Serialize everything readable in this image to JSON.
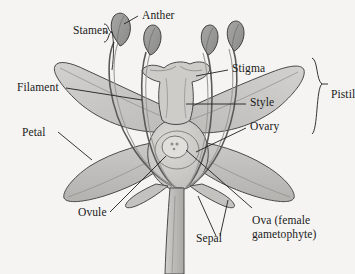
{
  "figure": {
    "type": "botanical-diagram",
    "background_color": "#f5f4f2",
    "line_color": "#3a3a3a",
    "petal_fill": "#c9c8c6",
    "petal_fill_dark": "#b4b3b0",
    "anther_fill": "#9a9a98",
    "stem_fill": "#bdbcb9",
    "ovary_fill": "#cfcecb",
    "ovule_fill": "#dddcd9"
  },
  "labels": {
    "stamen": "Stamen",
    "anther": "Anther",
    "filament": "Filament",
    "petal": "Petal",
    "ovule": "Ovule",
    "sepal": "Sepal",
    "stigma": "Stigma",
    "style": "Style",
    "ovary": "Ovary",
    "pistil": "Pistil",
    "ova": "Ova (female gametophyte)"
  },
  "brackets": {
    "stamen_bracket": "Stamen",
    "pistil_bracket": "Pistil"
  },
  "parts": {
    "petals": 4,
    "stamens": 4,
    "sepals": 3,
    "pistil_components": [
      "Stigma",
      "Style",
      "Ovary"
    ]
  }
}
